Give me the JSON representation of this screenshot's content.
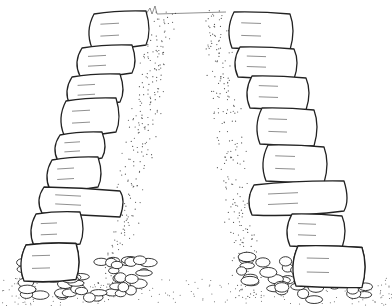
{
  "image": {
    "description": "Line drawing cross-section of a dry stone wall with two battered faces of stacked slab stones on a cobble foundation and rubble/earth core",
    "width": 392,
    "height": 308,
    "colors": {
      "background": "#ffffff",
      "ink": "#222222"
    }
  },
  "left_face": {
    "stones": [
      {
        "x": 88,
        "y": 14,
        "w": 62,
        "h": 34,
        "skew": -6
      },
      {
        "x": 76,
        "y": 48,
        "w": 60,
        "h": 28,
        "skew": -6
      },
      {
        "x": 66,
        "y": 77,
        "w": 58,
        "h": 28,
        "skew": -6
      },
      {
        "x": 60,
        "y": 101,
        "w": 60,
        "h": 34,
        "skew": -6
      },
      {
        "x": 54,
        "y": 135,
        "w": 52,
        "h": 26,
        "skew": -6
      },
      {
        "x": 46,
        "y": 160,
        "w": 56,
        "h": 30,
        "skew": -6
      },
      {
        "x": 38,
        "y": 187,
        "w": 86,
        "h": 26,
        "skew": 8
      },
      {
        "x": 30,
        "y": 214,
        "w": 54,
        "h": 32,
        "skew": -4
      },
      {
        "x": 20,
        "y": 245,
        "w": 60,
        "h": 36,
        "skew": -3
      }
    ]
  },
  "right_face": {
    "stones": [
      {
        "x": 228,
        "y": 12,
        "w": 66,
        "h": 36,
        "skew": 4
      },
      {
        "x": 234,
        "y": 47,
        "w": 64,
        "h": 30,
        "skew": 4
      },
      {
        "x": 246,
        "y": 76,
        "w": 64,
        "h": 32,
        "skew": 4
      },
      {
        "x": 256,
        "y": 108,
        "w": 62,
        "h": 36,
        "skew": 4
      },
      {
        "x": 262,
        "y": 145,
        "w": 66,
        "h": 36,
        "skew": 4
      },
      {
        "x": 248,
        "y": 185,
        "w": 100,
        "h": 30,
        "skew": -8
      },
      {
        "x": 286,
        "y": 214,
        "w": 60,
        "h": 32,
        "skew": 4
      },
      {
        "x": 292,
        "y": 246,
        "w": 74,
        "h": 40,
        "skew": 3
      }
    ]
  },
  "foundation": {
    "cobbles_left_area": {
      "x": 20,
      "y": 260,
      "w": 130,
      "h": 40
    },
    "cobbles_right_area": {
      "x": 236,
      "y": 255,
      "w": 130,
      "h": 45
    }
  }
}
